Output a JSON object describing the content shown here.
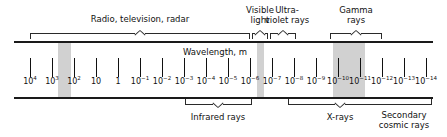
{
  "chart_data": {
    "type": "table",
    "axis_title": "Wavelength, m",
    "xlabel": "Wavelength, m",
    "tick_labels": [
      "10⁴",
      "10³",
      "10²",
      "10",
      "1",
      "10⁻¹",
      "10⁻²",
      "10⁻³",
      "10⁻⁴",
      "10⁻⁵",
      "10⁻⁶",
      "10⁻⁷",
      "10⁻⁸",
      "10⁻⁹",
      "10⁻¹⁰",
      "10⁻¹¹",
      "10⁻¹²",
      "10⁻¹³",
      "10⁻¹⁴"
    ],
    "ticks": [
      {
        "base": "10",
        "exp": "4",
        "x": 30
      },
      {
        "base": "10",
        "exp": "3",
        "x": 52
      },
      {
        "base": "10",
        "exp": "2",
        "x": 74
      },
      {
        "base": "10",
        "exp": "",
        "x": 96
      },
      {
        "base": "1",
        "exp": "",
        "x": 118
      },
      {
        "base": "10",
        "exp": "-1",
        "x": 140
      },
      {
        "base": "10",
        "exp": "-2",
        "x": 162
      },
      {
        "base": "10",
        "exp": "-3",
        "x": 184
      },
      {
        "base": "10",
        "exp": "-4",
        "x": 206
      },
      {
        "base": "10",
        "exp": "-5",
        "x": 228
      },
      {
        "base": "10",
        "exp": "-6",
        "x": 250
      },
      {
        "base": "10",
        "exp": "-7",
        "x": 272
      },
      {
        "base": "10",
        "exp": "-8",
        "x": 294
      },
      {
        "base": "10",
        "exp": "-9",
        "x": 316
      },
      {
        "base": "10",
        "exp": "-10",
        "x": 338
      },
      {
        "base": "10",
        "exp": "-11",
        "x": 360
      },
      {
        "base": "10",
        "exp": "-12",
        "x": 382
      },
      {
        "base": "10",
        "exp": "-13",
        "x": 404
      },
      {
        "base": "10",
        "exp": "-14",
        "x": 426
      }
    ],
    "bands": [
      {
        "name": "broadcast-band",
        "x": 58,
        "width": 13
      },
      {
        "name": "visible-band",
        "x": 257,
        "width": 7
      },
      {
        "name": "gamma-xray-band",
        "x": 333,
        "width": 32
      }
    ],
    "regions_above": [
      {
        "name": "radio-television-radar",
        "label": "Radio, television, radar",
        "lines": [
          "Radio, television, radar"
        ],
        "start": 30,
        "end": 250,
        "peak": 140,
        "label_x": 140,
        "label_y": 14
      },
      {
        "name": "visible-light",
        "label": "Visible light",
        "lines": [
          "Visible",
          "light"
        ],
        "start": 252,
        "end": 268,
        "peak": 260,
        "label_x": 260,
        "label_y": 5
      },
      {
        "name": "ultraviolet-rays",
        "label": "Ultra-violet rays",
        "lines": [
          "Ultra-",
          "violet rays"
        ],
        "start": 270,
        "end": 296,
        "peak": 283,
        "label_x": 287,
        "label_y": 5
      },
      {
        "name": "gamma-rays",
        "label": "Gamma rays",
        "lines": [
          "Gamma",
          "rays"
        ],
        "start": 330,
        "end": 382,
        "peak": 356,
        "label_x": 356,
        "label_y": 5
      }
    ],
    "regions_below": [
      {
        "name": "infrared-rays",
        "label": "Infrared rays",
        "lines": [
          "Infrared rays"
        ],
        "start": 185,
        "end": 252,
        "peak": 218,
        "label_x": 218,
        "label_y": 112
      },
      {
        "name": "x-rays",
        "label": "X-rays",
        "lines": [
          "X-rays"
        ],
        "start": 288,
        "end": 432,
        "peak": 340,
        "label_x": 340,
        "label_y": 112
      },
      {
        "name": "secondary-cosmic-rays",
        "label": "Secondary cosmic rays",
        "lines": [
          "Secondary",
          "cosmic rays"
        ],
        "start": 0,
        "end": 0,
        "peak": 0,
        "label_x": 404,
        "label_y": 110
      }
    ],
    "colors": {
      "line": "#1a1a1a",
      "band": "#c9c9c9",
      "text": "#111111",
      "background": "#ffffff"
    }
  }
}
